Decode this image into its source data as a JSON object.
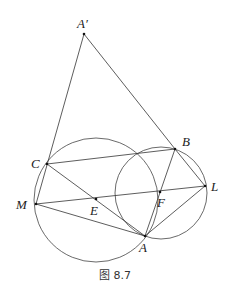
{
  "caption": "图 8.7",
  "points": {
    "Aprime": {
      "label": "A′",
      "x": 84,
      "y": 34,
      "lx": 77,
      "ly": 28
    },
    "B": {
      "label": "B",
      "x": 175,
      "y": 149,
      "lx": 182,
      "ly": 146
    },
    "C": {
      "label": "C",
      "x": 47,
      "y": 164,
      "lx": 31,
      "ly": 168
    },
    "M": {
      "label": "M",
      "x": 36,
      "y": 204,
      "lx": 16,
      "ly": 209
    },
    "E": {
      "label": "E",
      "x": 96,
      "y": 199,
      "lx": 90,
      "ly": 215
    },
    "F": {
      "label": "F",
      "x": 160,
      "y": 192,
      "lx": 157,
      "ly": 207
    },
    "L": {
      "label": "L",
      "x": 205,
      "y": 186,
      "lx": 211,
      "ly": 191
    },
    "A": {
      "label": "A",
      "x": 145,
      "y": 236,
      "lx": 139,
      "ly": 252
    }
  },
  "circles": [
    {
      "name": "left-circle",
      "cx": 96,
      "cy": 200,
      "r": 62
    },
    {
      "name": "right-circle",
      "cx": 161,
      "cy": 193,
      "r": 46
    }
  ],
  "segments": [
    [
      "Aprime",
      "M"
    ],
    [
      "Aprime",
      "B"
    ],
    [
      "C",
      "B"
    ],
    [
      "C",
      "A"
    ],
    [
      "M",
      "L"
    ],
    [
      "M",
      "A"
    ],
    [
      "B",
      "A"
    ],
    [
      "B",
      "L"
    ],
    [
      "L",
      "A"
    ]
  ]
}
